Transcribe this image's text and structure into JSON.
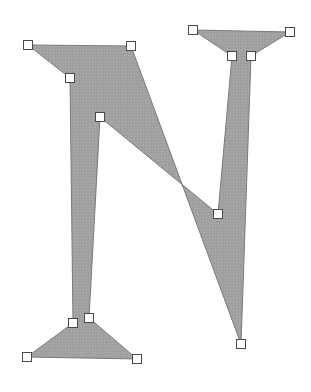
{
  "canvas": {
    "width": 311,
    "height": 392,
    "background": "#ffffff"
  },
  "shape": {
    "name": "letter-n-polygon",
    "fill": "#a3a3a3",
    "stroke": "#7a7a7a",
    "points": [
      [
        28,
        45
      ],
      [
        131,
        46
      ],
      [
        241,
        344
      ],
      [
        251,
        56
      ],
      [
        290,
        32
      ],
      [
        193,
        30
      ],
      [
        232,
        56
      ],
      [
        218,
        214
      ],
      [
        100,
        117
      ],
      [
        89,
        318
      ],
      [
        137,
        359
      ],
      [
        27,
        357
      ],
      [
        73,
        323
      ],
      [
        70,
        78
      ]
    ]
  },
  "handles": {
    "size": 10,
    "fill": "#ffffff",
    "stroke": "#4a4a4a"
  }
}
